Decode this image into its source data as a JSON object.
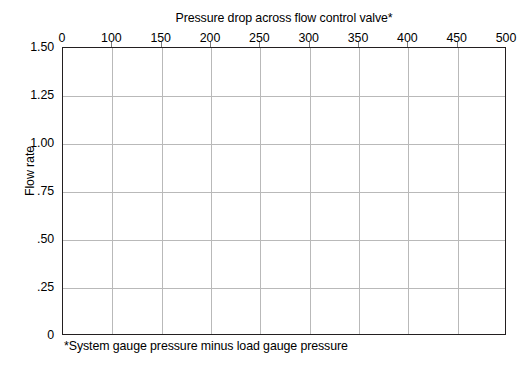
{
  "chart_data": {
    "type": "line",
    "title": "Pressure drop across flow control valve*",
    "xlabel": "Pressure drop across flow control valve*",
    "ylabel": "Flow rate",
    "footnote": "*System gauge pressure minus load gauge pressure",
    "series": [],
    "values": [],
    "x": [],
    "categories": [],
    "xlim": [
      0,
      500
    ],
    "ylim": [
      0,
      1.5
    ],
    "xaxis_position": "top",
    "yaxis_position": "left",
    "grid": true,
    "legend": "none",
    "note": "Blank plotting grid — no data series plotted",
    "xticklabels": [
      "0",
      "100",
      "150",
      "200",
      "250",
      "300",
      "350",
      "400",
      "450",
      "500"
    ],
    "xtick_positions_px": [
      0,
      49.3,
      98.7,
      148,
      197.3,
      246.7,
      296,
      345.3,
      394.7,
      444
    ],
    "yticklabels": [
      "1.50",
      "1.25",
      "1.00",
      ".75",
      ".50",
      ".25",
      "0"
    ],
    "ytick_values": [
      1.5,
      1.25,
      1.0,
      0.75,
      0.5,
      0.25,
      0
    ],
    "colors": {
      "axis": "#231f20",
      "grid": "#b9b9b9",
      "tick": "#7d7d7d",
      "text": "#000000",
      "background": "#ffffff"
    }
  }
}
